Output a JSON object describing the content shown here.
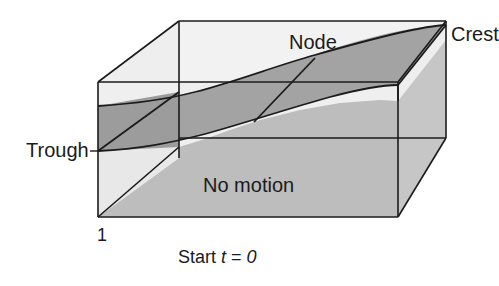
{
  "figure": {
    "caption": "Start t = 0",
    "caption_parts": {
      "word": "Start",
      "var": "t",
      "eq": "=",
      "value": "0"
    },
    "labels": {
      "trough": "Trough",
      "crest": "Crest",
      "node": "Node",
      "no_motion": "No motion",
      "axis_tick": "1"
    },
    "colors": {
      "background": "#ffffff",
      "outline": "#1b1b1b",
      "face_light": "#eeeeee",
      "face_top": "#f4f4f4",
      "face_mid": "#e2e2e2",
      "band_shade": "#a8a8a8",
      "floor_shade": "#b4b4b4",
      "text": "#1b1b1b"
    },
    "geometry": {
      "front_face": {
        "left": 98,
        "top": 82,
        "right": 398,
        "bottom": 217
      },
      "depth_offset": {
        "dx": 81,
        "dy": -61
      },
      "trough_point": {
        "x": 98,
        "y": 151
      },
      "crest_point": {
        "x": 446,
        "y": 25
      },
      "node_line": {
        "x1": 254,
        "y1": 122,
        "x2": 315,
        "y2": 58
      }
    }
  }
}
